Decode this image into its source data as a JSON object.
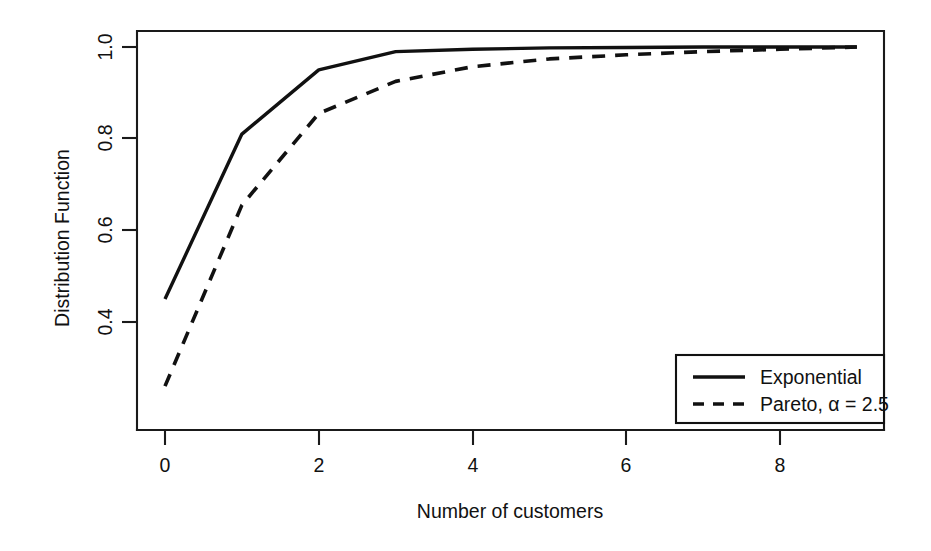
{
  "chart_data": {
    "type": "line",
    "title": "",
    "subtitle": "",
    "xlabel": "Number of customers",
    "ylabel": "Distribution Function",
    "xlim": [
      -0.45,
      9.45
    ],
    "ylim": [
      0.24,
      1.035
    ],
    "grid": false,
    "legend_position": "bottom-right",
    "x": [
      0,
      1,
      2,
      3,
      4,
      5,
      6,
      7,
      8,
      9
    ],
    "xticks": [
      "0",
      "2",
      "4",
      "6",
      "8"
    ],
    "xtick_values": [
      0,
      2,
      4,
      6,
      8
    ],
    "yticks": [
      "0.4",
      "0.6",
      "0.8",
      "1.0"
    ],
    "ytick_values": [
      0.4,
      0.6,
      0.8,
      1.0
    ],
    "series": [
      {
        "name": "Exponential",
        "style": "solid",
        "color": "#111111",
        "values": [
          0.45,
          0.81,
          0.95,
          0.99,
          0.995,
          0.998,
          0.999,
          1.0,
          1.0,
          1.0
        ]
      },
      {
        "name": "Pareto, α = 2.5",
        "style": "dashed",
        "color": "#111111",
        "values": [
          0.26,
          0.655,
          0.855,
          0.925,
          0.957,
          0.974,
          0.983,
          0.99,
          0.995,
          1.0
        ]
      }
    ]
  },
  "axes": {
    "y_title": "Distribution Function",
    "x_title": "Number of customers",
    "x_tick_labels": [
      "0",
      "2",
      "4",
      "6",
      "8"
    ],
    "y_tick_labels": [
      "0.4",
      "0.6",
      "0.8",
      "1.0"
    ]
  },
  "legend": {
    "entries": [
      {
        "label": "Exponential",
        "style": "solid"
      },
      {
        "label": "Pareto, α = 2.5",
        "style": "dashed"
      }
    ]
  },
  "colors": {
    "line": "#111111",
    "axis": "#1a1a1a",
    "background": "#ffffff"
  }
}
